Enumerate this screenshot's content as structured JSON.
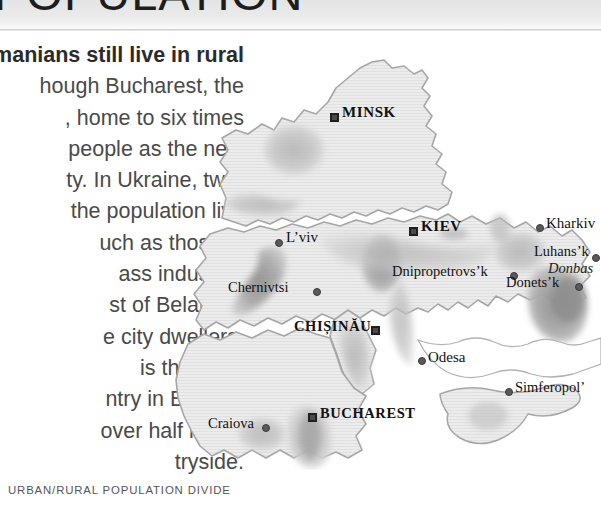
{
  "header": {
    "title_fragment": "POPULATION",
    "note": "heading cropped at top of page"
  },
  "article": {
    "lead_in": "manians",
    "lines": [
      "manians still live in rural",
      "hough Bucharest, the",
      ", home to six times",
      "people as the next",
      "ty. In Ukraine, two-",
      "the population live",
      "uch as those in",
      "ass industrial",
      "st of Belarus’s",
      "e city dwellers.",
      "is the most",
      "ntry in Eastern",
      "over half live in",
      "tryside."
    ]
  },
  "figure": {
    "caption": "URBAN/RURAL POPULATION DIVIDE"
  },
  "map": {
    "colors": {
      "land": "#e9e9e9",
      "land_stroke": "#a9a9a9",
      "shade_light": "#d4d4d4",
      "shade_mid": "#bdbdbd",
      "shade_dark": "#9a9a9a",
      "shade_darkest": "#8b8b8b",
      "sea": "#ffffff",
      "label": "#111111"
    },
    "capitals": [
      {
        "name": "MINSK",
        "marker": "square",
        "x": 330,
        "y": 118
      },
      {
        "name": "KIEV",
        "marker": "square",
        "x": 409,
        "y": 232
      },
      {
        "name": "CHIȘINĂU",
        "marker": "square",
        "x": 371,
        "y": 331
      },
      {
        "name": "BUCHAREST",
        "marker": "square",
        "x": 308,
        "y": 418
      }
    ],
    "cities": [
      {
        "name": "L’viv",
        "marker": "dot",
        "x": 275,
        "y": 243
      },
      {
        "name": "Kharkiv",
        "marker": "dot",
        "x": 536,
        "y": 228
      },
      {
        "name": "Chernivtsi",
        "marker": "dot",
        "x": 313,
        "y": 292
      },
      {
        "name": "Dnipropetrovs’k",
        "marker": "dot",
        "x": 510,
        "y": 276
      },
      {
        "name": "Luhans’k",
        "marker": "dot",
        "x": 592,
        "y": 258
      },
      {
        "name": "Donets’k",
        "marker": "dot",
        "x": 575,
        "y": 287
      },
      {
        "name": "Odesa",
        "marker": "dot",
        "x": 418,
        "y": 361
      },
      {
        "name": "Simferopol’",
        "marker": "dot",
        "x": 505,
        "y": 392
      },
      {
        "name": "Craiova",
        "marker": "dot",
        "x": 262,
        "y": 428
      }
    ],
    "regions": [
      {
        "name": "Donbas",
        "style": "italic",
        "x": 557,
        "y": 268
      }
    ]
  }
}
